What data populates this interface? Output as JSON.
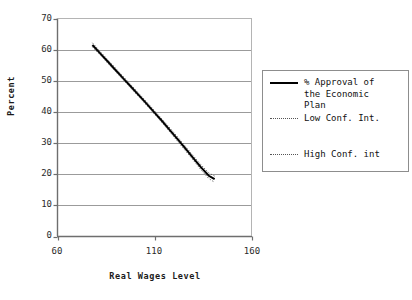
{
  "chart_data": {
    "type": "line",
    "title": "",
    "xlabel": "Real Wages Level",
    "ylabel": "Percent",
    "xlim": [
      60,
      160
    ],
    "ylim": [
      0,
      70
    ],
    "xticks": [
      "60",
      "110",
      "160"
    ],
    "xtick_values": [
      60,
      110,
      160
    ],
    "yticks": [
      "0",
      "10",
      "20",
      "30",
      "40",
      "50",
      "60",
      "70"
    ],
    "ytick_values": [
      0,
      10,
      20,
      30,
      40,
      50,
      60,
      70
    ],
    "grid": "horizontal",
    "legend_position": "right",
    "x": [
      78,
      82,
      86,
      90,
      94,
      98,
      102,
      106,
      110,
      114,
      118,
      122,
      126,
      130,
      134,
      138,
      141
    ],
    "series": [
      {
        "name": "% Approval of the Economic Plan",
        "style": "solid",
        "color": "#000000",
        "values": [
          61.5,
          58.8,
          56.1,
          53.4,
          50.7,
          48.0,
          45.3,
          42.6,
          39.8,
          37.0,
          34.1,
          31.2,
          28.2,
          25.2,
          22.2,
          19.5,
          18.4
        ]
      },
      {
        "name": "Low Conf. Int.",
        "style": "dotted",
        "color": "#555555",
        "values": [
          60.9,
          58.3,
          55.6,
          52.9,
          50.2,
          47.5,
          44.8,
          42.1,
          39.3,
          36.5,
          33.5,
          30.5,
          27.5,
          24.5,
          21.4,
          18.6,
          17.4
        ]
      },
      {
        "name": "High Conf. int",
        "style": "dotted",
        "color": "#555555",
        "values": [
          62.2,
          59.4,
          56.7,
          54.0,
          51.3,
          48.6,
          45.9,
          43.2,
          40.4,
          37.6,
          34.8,
          31.9,
          28.9,
          25.9,
          23.0,
          20.4,
          19.4
        ]
      }
    ]
  },
  "legend": {
    "items": [
      {
        "label": "% Approval of\nthe Economic\nPlan",
        "style": "solid"
      },
      {
        "label": "Low Conf. Int.",
        "style": "dotted"
      },
      {
        "label": "High Conf. int",
        "style": "dotted"
      }
    ]
  },
  "axes": {
    "ylabel": "Percent",
    "xlabel": "Real Wages Level",
    "y_tick_labels": [
      "70",
      "60",
      "50",
      "40",
      "30",
      "20",
      "10",
      "0"
    ],
    "x_tick_labels": [
      "60",
      "110",
      "160"
    ]
  },
  "colors": {
    "line": "#000000",
    "conf_band": "#555555",
    "grid": "#9b9b9b",
    "axis": "#6e6e6e",
    "text": "#111111"
  }
}
